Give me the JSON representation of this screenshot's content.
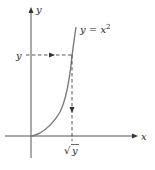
{
  "diagram": {
    "type": "function-graph",
    "colors": {
      "axis": "#555555",
      "curve": "#7a7a7a",
      "dashed": "#444444",
      "text": "#2a2a2a"
    },
    "labels": {
      "y_axis": "y",
      "x_axis": "x",
      "curve_prefix": "y = x",
      "curve_exponent": "2",
      "y_value": "y",
      "sqrt_symbol": "√",
      "sqrt_arg": "y"
    },
    "curve": {
      "equation": "y = x^2",
      "domain": "x >= 0"
    },
    "guides": [
      {
        "name": "horizontal-guide",
        "from": "y on y-axis",
        "to": "curve",
        "arrow": "right"
      },
      {
        "name": "vertical-guide",
        "from": "curve",
        "to": "sqrt(y) on x-axis",
        "arrow": "down"
      }
    ]
  }
}
